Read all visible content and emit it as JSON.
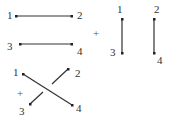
{
  "colors": {
    "line": "#333333",
    "text": "#333333"
  },
  "diagrams": [
    {
      "name": "horizontal-pair",
      "labels": [
        "1",
        "2",
        "3",
        "4"
      ]
    },
    {
      "name": "vertical-pair",
      "labels": [
        "1",
        "2",
        "3",
        "4"
      ]
    },
    {
      "name": "crossing-pair",
      "labels": [
        "1",
        "2",
        "3",
        "4"
      ]
    }
  ],
  "operators": [
    "+",
    "+"
  ]
}
